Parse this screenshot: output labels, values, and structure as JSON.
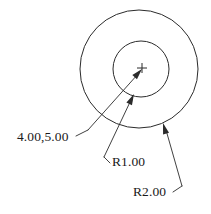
{
  "drawing": {
    "title": "Concentric circles with radius and center dimensions",
    "background_color": "#ffffff",
    "line_color": "#2b2b2b",
    "text_color": "#1a1a1a",
    "canvas": {
      "width": 211,
      "height": 214
    },
    "center_point": {
      "x": 142,
      "y": 68
    },
    "circles": [
      {
        "name": "outer-circle",
        "cx": 139,
        "cy": 69,
        "r": 59,
        "label": "R2.00"
      },
      {
        "name": "inner-circle",
        "cx": 141,
        "cy": 69,
        "r": 28,
        "label": "R1.00"
      }
    ],
    "center_mark": {
      "name": "center-cross",
      "x": 142,
      "y": 68,
      "size": 5,
      "label": "4.00,5.00"
    },
    "annotations": [
      {
        "id": "center-coordinate",
        "text": "4.00,5.00",
        "text_x": 17,
        "text_y": 141,
        "shoulder": {
          "x1": 76,
          "y1": 136,
          "x2": 88,
          "y2": 130
        },
        "leader": {
          "x1": 88,
          "y1": 130,
          "x2": 138,
          "y2": 74
        },
        "arrow_at": {
          "x": 142,
          "y": 69
        },
        "arrow_angle": -48
      },
      {
        "id": "inner-radius",
        "text": "R1.00",
        "text_x": 112,
        "text_y": 166,
        "shoulder": {
          "x1": 110,
          "y1": 163,
          "x2": 104,
          "y2": 157
        },
        "leader": {
          "x1": 104,
          "y1": 157,
          "x2": 131,
          "y2": 100
        },
        "arrow_at": {
          "x": 134,
          "y": 94
        },
        "arrow_angle": -64
      },
      {
        "id": "outer-radius",
        "text": "R2.00",
        "text_x": 133,
        "text_y": 196,
        "shoulder": {
          "x1": 173,
          "y1": 192,
          "x2": 182,
          "y2": 186
        },
        "leader": {
          "x1": 182,
          "y1": 186,
          "x2": 166,
          "y2": 130
        },
        "arrow_at": {
          "x": 163,
          "y": 123
        },
        "arrow_angle": -106
      }
    ]
  }
}
